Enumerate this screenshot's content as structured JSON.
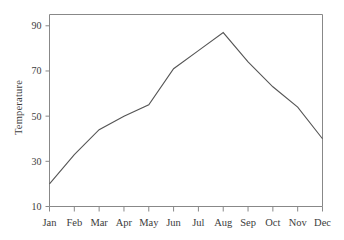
{
  "chart_data": {
    "type": "line",
    "title": "",
    "xlabel": "",
    "ylabel": "Temperature",
    "categories": [
      "Jan",
      "Feb",
      "Mar",
      "Apr",
      "May",
      "Jun",
      "Jul",
      "Aug",
      "Sep",
      "Oct",
      "Nov",
      "Dec"
    ],
    "values": [
      20,
      33,
      44,
      50,
      55,
      71,
      79,
      87,
      74,
      63,
      54,
      40
    ],
    "series": [
      {
        "name": "Temperature",
        "values": [
          20,
          33,
          44,
          50,
          55,
          71,
          79,
          87,
          74,
          63,
          54,
          40
        ]
      }
    ],
    "ylim": [
      10,
      95
    ],
    "yticks": [
      10,
      30,
      50,
      70,
      90
    ],
    "ytick_labels": [
      "10",
      "30",
      "50",
      "70",
      "90"
    ],
    "xtick_labels": [
      "Jan",
      "Feb",
      "Mar",
      "Apr",
      "May",
      "Jun",
      "Jul",
      "Aug",
      "Sep",
      "Oct",
      "Nov",
      "Dec"
    ],
    "grid": false,
    "legend": false,
    "legend_position": "none",
    "line_color": "#555555",
    "axis_color": "#888888",
    "background_color": "#ffffff",
    "marker": "none"
  },
  "axis": {
    "y_title": "Temperature"
  }
}
